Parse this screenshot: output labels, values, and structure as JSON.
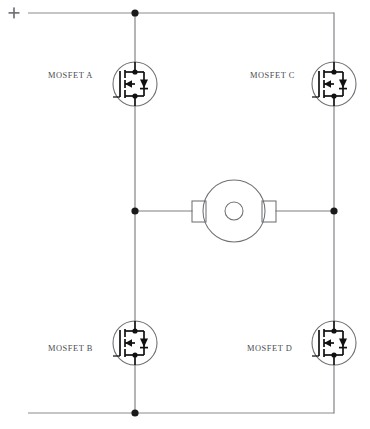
{
  "diagram": {
    "supply_marker": "+",
    "colors": {
      "wire": "#7d7f82",
      "symbol": "#111111",
      "label": "#4a4c50",
      "background": "#ffffff"
    }
  },
  "labels": {
    "mosfet_a": "MOSFET A",
    "mosfet_b": "MOSFET B",
    "mosfet_c": "MOSFET C",
    "mosfet_d": "MOSFET D"
  },
  "components": {
    "mosfets": [
      {
        "id": "A",
        "label": "MOSFET A",
        "cx": 135,
        "cy": 84,
        "r": 22,
        "position": "top-left"
      },
      {
        "id": "C",
        "label": "MOSFET C",
        "cx": 334,
        "cy": 84,
        "r": 22,
        "position": "top-right"
      },
      {
        "id": "B",
        "label": "MOSFET B",
        "cx": 135,
        "cy": 343,
        "r": 22,
        "position": "bottom-left"
      },
      {
        "id": "D",
        "label": "MOSFET D",
        "cx": 334,
        "cy": 343,
        "r": 22,
        "position": "bottom-right"
      }
    ],
    "motor": {
      "cx": 234,
      "cy": 211,
      "r": 31,
      "shaft_r": 9
    },
    "junction_dots": [
      {
        "x": 135,
        "y": 13
      },
      {
        "x": 135,
        "y": 211
      },
      {
        "x": 334,
        "y": 211
      },
      {
        "x": 135,
        "y": 413
      }
    ]
  },
  "nets": {
    "top_rail_y": 13,
    "bottom_rail_y": 413,
    "left_branch_x": 135,
    "right_branch_x": 334,
    "mid_y": 211
  }
}
